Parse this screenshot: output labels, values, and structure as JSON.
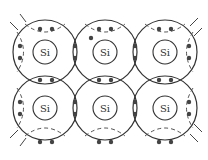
{
  "diagram": {
    "element_symbol": "Si",
    "grid": {
      "rows": 2,
      "cols": 3
    },
    "atoms": [
      {
        "label": "Si",
        "cx": 45,
        "cy": 52
      },
      {
        "label": "Si",
        "cx": 105,
        "cy": 52
      },
      {
        "label": "Si",
        "cx": 165,
        "cy": 52
      },
      {
        "label": "Si",
        "cx": 45,
        "cy": 108
      },
      {
        "label": "Si",
        "cx": 105,
        "cy": 108
      },
      {
        "label": "Si",
        "cx": 165,
        "cy": 108
      }
    ],
    "outer_radius": 32,
    "inner_radius": 12,
    "electron_radius": 2.2,
    "colors": {
      "line": "#333333",
      "electron": "#444444",
      "background": "#ffffff"
    }
  }
}
